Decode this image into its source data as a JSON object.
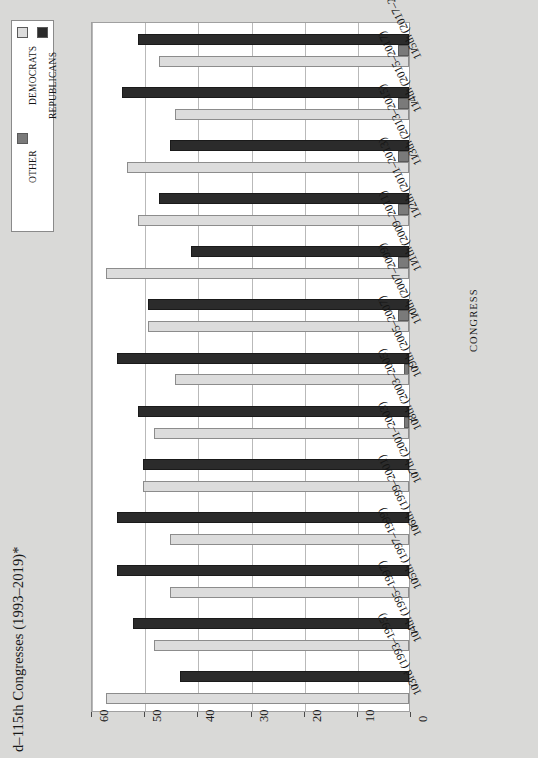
{
  "title": "d–115th Congresses (1993–2019)*",
  "legend": {
    "items": [
      {
        "label": "DEMOCRATS",
        "color": "#dcdcdc"
      },
      {
        "label": "OTHER",
        "color": "#7a7a7a"
      },
      {
        "label": "REPUBLICANS",
        "color": "#2b2b2b"
      }
    ]
  },
  "axis_title": "CONGRESS",
  "xticks": [
    "60",
    "50",
    "40",
    "30",
    "20",
    "10",
    "0"
  ],
  "chart_data": {
    "type": "bar",
    "orientation": "horizontal",
    "title": "d–115th Congresses (1993–2019)*",
    "xlabel": "",
    "ylabel": "CONGRESS",
    "xlim": [
      0,
      60
    ],
    "xticks": [
      60,
      50,
      40,
      30,
      20,
      10,
      0
    ],
    "axis_reversed": true,
    "grid": true,
    "legend_position": "top-left",
    "categories": [
      "103rd (1993–1995)",
      "104th (1995–1997)",
      "105th (1997–1999)",
      "106th (1999–2001)",
      "107th (2001–2003)",
      "108th (2003–2005)",
      "109th (2005–2007)",
      "110th (2007–2009)",
      "111th (2009–2011)",
      "112th (2011–2013)",
      "113th (2013–2015)",
      "114th (2015–2017)",
      "115th (2017–2019)"
    ],
    "series": [
      {
        "name": "DEMOCRATS",
        "color": "#dcdcdc",
        "values": [
          57,
          48,
          45,
          45,
          50,
          48,
          44,
          49,
          57,
          51,
          53,
          44,
          47
        ]
      },
      {
        "name": "OTHER",
        "color": "#7a7a7a",
        "values": [
          0,
          0,
          0,
          0,
          0,
          1,
          1,
          2,
          2,
          2,
          2,
          2,
          2
        ]
      },
      {
        "name": "REPUBLICANS",
        "color": "#2b2b2b",
        "values": [
          43,
          52,
          55,
          55,
          50,
          51,
          55,
          49,
          41,
          47,
          45,
          54,
          51
        ]
      }
    ]
  }
}
